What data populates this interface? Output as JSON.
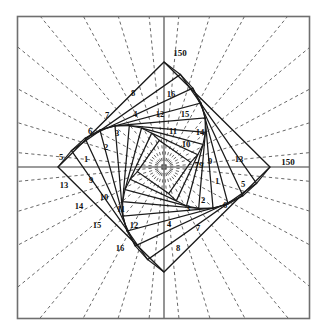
{
  "figure": {
    "type": "geometric-diagram",
    "canvas": {
      "width": 326,
      "height": 332
    },
    "colors": {
      "frame": "#6f6f6f",
      "axis": "#7a7a7a",
      "solid_line": "#1a1a1a",
      "dashed_line": "#4d4d4d",
      "background": "#ffffff",
      "text": "#111111"
    },
    "frame": {
      "x": 17,
      "y": 16,
      "width": 293,
      "height": 303
    },
    "center": {
      "x": 164,
      "y": 167
    },
    "axes": {
      "horizontal": {
        "y": 167,
        "x1": 17,
        "x2": 310
      },
      "vertical": {
        "x": 164,
        "y1": 16,
        "y2": 319
      }
    },
    "diamonds": [
      {
        "name": "outer-diamond",
        "radius_x": 106,
        "radius_y": 105,
        "rotation_deg": 0
      },
      {
        "name": "diamond-2",
        "radius": 94,
        "rotation_deg": 10
      },
      {
        "name": "diamond-3",
        "radius": 84,
        "rotation_deg": 20
      },
      {
        "name": "diamond-4",
        "radius": 74,
        "rotation_deg": 30
      },
      {
        "name": "diamond-5",
        "radius": 64,
        "rotation_deg": 40
      },
      {
        "name": "diamond-6",
        "radius": 54,
        "rotation_deg": 50
      },
      {
        "name": "diamond-7",
        "radius": 45,
        "rotation_deg": 60
      },
      {
        "name": "diamond-8",
        "radius": 36,
        "rotation_deg": 70
      },
      {
        "name": "diamond-9",
        "radius": 27,
        "rotation_deg": 80
      }
    ],
    "dashed_rays": {
      "count": 32,
      "description": "radial dashed rays emanating from the center to the outer frame"
    },
    "axis_labels": [
      {
        "id": "top-150",
        "text": "150",
        "x": 180,
        "y": 53
      },
      {
        "id": "right-150",
        "text": "150",
        "x": 288,
        "y": 162
      }
    ],
    "center_label": {
      "id": "center-79",
      "text": "79",
      "x": 199,
      "y": 165
    },
    "cell_labels": [
      {
        "id": "q2-5",
        "text": "5",
        "x": 61,
        "y": 157
      },
      {
        "id": "q2-1",
        "text": "1",
        "x": 86,
        "y": 159
      },
      {
        "id": "q2-2",
        "text": "2",
        "x": 106,
        "y": 147
      },
      {
        "id": "q2-6",
        "text": "6",
        "x": 90,
        "y": 131
      },
      {
        "id": "q2-3",
        "text": "3",
        "x": 117,
        "y": 133
      },
      {
        "id": "q2-7",
        "text": "7",
        "x": 107,
        "y": 115
      },
      {
        "id": "q2-4",
        "text": "4",
        "x": 135,
        "y": 114
      },
      {
        "id": "q2-8",
        "text": "8",
        "x": 133,
        "y": 93
      },
      {
        "id": "q1-16",
        "text": "16",
        "x": 171,
        "y": 94
      },
      {
        "id": "q1-12",
        "text": "12",
        "x": 160,
        "y": 114
      },
      {
        "id": "q1-15",
        "text": "15",
        "x": 185,
        "y": 114
      },
      {
        "id": "q1-11",
        "text": "11",
        "x": 173,
        "y": 131
      },
      {
        "id": "q1-14",
        "text": "14",
        "x": 200,
        "y": 132
      },
      {
        "id": "q1-10",
        "text": "10",
        "x": 186,
        "y": 144
      },
      {
        "id": "q1-9",
        "text": "9",
        "x": 210,
        "y": 161
      },
      {
        "id": "q1-13",
        "text": "13",
        "x": 239,
        "y": 159
      },
      {
        "id": "q3-13",
        "text": "13",
        "x": 64,
        "y": 185
      },
      {
        "id": "q3-9",
        "text": "9",
        "x": 91,
        "y": 180
      },
      {
        "id": "q3-14",
        "text": "14",
        "x": 79,
        "y": 206
      },
      {
        "id": "q3-10",
        "text": "10",
        "x": 104,
        "y": 197
      },
      {
        "id": "q3-11",
        "text": "11",
        "x": 121,
        "y": 209
      },
      {
        "id": "q3-15",
        "text": "15",
        "x": 97,
        "y": 225
      },
      {
        "id": "q3-12",
        "text": "12",
        "x": 134,
        "y": 225
      },
      {
        "id": "q3-16",
        "text": "16",
        "x": 120,
        "y": 248
      },
      {
        "id": "q4-1",
        "text": "1",
        "x": 217,
        "y": 181
      },
      {
        "id": "q4-5",
        "text": "5",
        "x": 243,
        "y": 184
      },
      {
        "id": "q4-2",
        "text": "2",
        "x": 203,
        "y": 200
      },
      {
        "id": "q4-6",
        "text": "6",
        "x": 225,
        "y": 205
      },
      {
        "id": "q4-3",
        "text": "3",
        "x": 188,
        "y": 208
      },
      {
        "id": "q4-4",
        "text": "4",
        "x": 169,
        "y": 224
      },
      {
        "id": "q4-7",
        "text": "7",
        "x": 198,
        "y": 228
      },
      {
        "id": "q4-8",
        "text": "8",
        "x": 178,
        "y": 248
      }
    ]
  }
}
